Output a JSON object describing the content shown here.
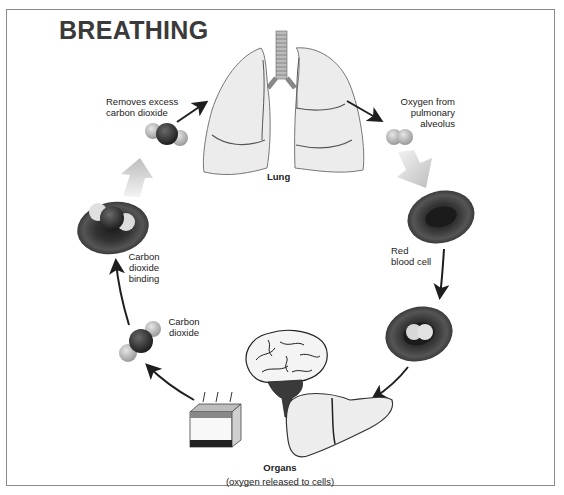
{
  "diagram": {
    "title": "BREATHING",
    "labels": {
      "removes_co2_line1": "Removes excess",
      "removes_co2_line2": "carbon dioxide",
      "oxygen_line1": "Oxygen from",
      "oxygen_line2": "pulmonary",
      "oxygen_line3": "alveolus",
      "lung": "Lung",
      "red_blood_cell_line1": "Red",
      "red_blood_cell_line2": "blood cell",
      "co2_binding_line1": "Carbon",
      "co2_binding_line2": "dioxide",
      "co2_binding_line3": "binding",
      "co2_line1": "Carbon",
      "co2_line2": "dioxide",
      "organs": "Organs",
      "organs_sub": "(oxygen released to cells)"
    },
    "nodes": [
      {
        "id": "lung",
        "icon": "lung-icon"
      },
      {
        "id": "oxygen-molecule",
        "icon": "oxygen-molecule-icon"
      },
      {
        "id": "red-blood-cell",
        "icon": "red-blood-cell-icon"
      },
      {
        "id": "oxygenated-cell",
        "icon": "oxygenated-red-blood-cell-icon"
      },
      {
        "id": "liver",
        "icon": "liver-icon"
      },
      {
        "id": "brain",
        "icon": "brain-icon"
      },
      {
        "id": "skin",
        "icon": "skin-tissue-icon"
      },
      {
        "id": "co2-molecule",
        "icon": "carbon-dioxide-molecule-icon"
      },
      {
        "id": "co2-bound-cell",
        "icon": "co2-bound-red-blood-cell-icon"
      },
      {
        "id": "co2-release",
        "icon": "carbon-dioxide-molecule-icon"
      }
    ],
    "colors": {
      "frame": "#8a8a8a",
      "title": "#3a3a3a",
      "lung_fill": "#ececec",
      "cell_dark": "#2a2a2a",
      "arrow": "#1e1e1e",
      "grey_arrow": "#c8c8c8"
    }
  }
}
